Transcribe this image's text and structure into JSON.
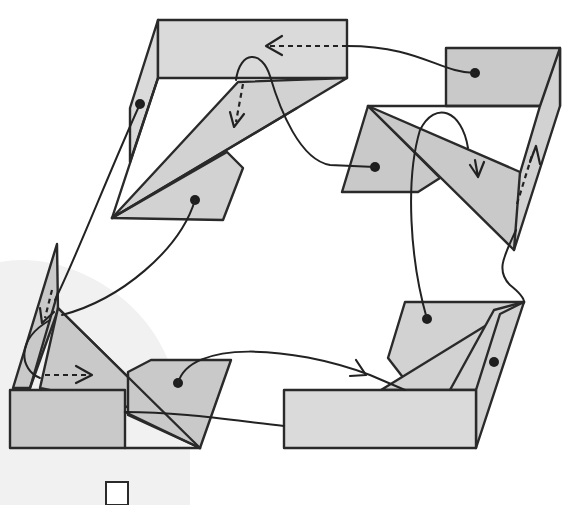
{
  "diagram": {
    "title": "",
    "colors": {
      "background": "#ffffff",
      "backdrop_shape": "#f1f1f1",
      "panel_light": "#dadada",
      "panel_mid": "#c9c9c9",
      "panel_dark": "#bdbdbd",
      "stroke": "#2a2a2a"
    },
    "stages": [
      {
        "id": "top-left",
        "label": "",
        "parts": [
          "top-panel",
          "left-flap",
          "long-triangle",
          "pentagon-tab"
        ],
        "markers": [
          "dashed-arrow-left",
          "dashed-arrow-down",
          "dot",
          "dot"
        ]
      },
      {
        "id": "top-right",
        "label": "",
        "parts": [
          "square-panel",
          "right-flap",
          "quad-tab",
          "diagonal-triangle"
        ],
        "markers": [
          "dot",
          "solid-arrow-down",
          "dashed-arrow-up"
        ]
      },
      {
        "id": "bottom-right",
        "label": "",
        "parts": [
          "bottom-panel",
          "pentagon-tab",
          "fan-triangles",
          "right-flap"
        ],
        "markers": [
          "dot",
          "dot"
        ]
      },
      {
        "id": "bottom-left",
        "label": "",
        "parts": [
          "front-panel",
          "tall-flap",
          "diagonal-triangle",
          "quad-tab"
        ],
        "markers": [
          "dashed-arrow-down",
          "dashed-arrow-right",
          "dot"
        ]
      }
    ],
    "connectors": [
      {
        "from": "top-right",
        "to": "top-left",
        "style": "curve-then-dashed-arrow"
      },
      {
        "from": "top-left",
        "to": "top-right",
        "style": "loop-curve"
      },
      {
        "from": "top-right",
        "to": "bottom-right",
        "style": "loop-curve"
      },
      {
        "from": "bottom-left",
        "to": "bottom-right",
        "style": "arrow-curve"
      },
      {
        "from": "top-left",
        "to": "bottom-left",
        "style": "curve"
      }
    ]
  }
}
